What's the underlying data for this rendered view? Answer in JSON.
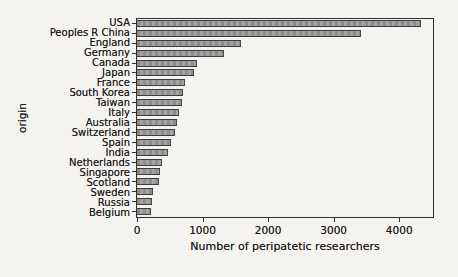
{
  "figure": {
    "background_color": "#f4f3ef",
    "bar_fill_color": "#989898",
    "bar_edge_color": "#3c3c3c",
    "frame_color": "#2e2e2e",
    "text_color": "#1b1b1b"
  },
  "chart_data": {
    "type": "bar",
    "orientation": "horizontal",
    "title": "",
    "xlabel": "Number of peripatetic researchers",
    "ylabel": "origin",
    "xlim": [
      0,
      4515
    ],
    "xticks": [
      0,
      1000,
      2000,
      3000,
      4000
    ],
    "grid": false,
    "legend": false,
    "categories": [
      "USA",
      "Peoples R China",
      "England",
      "Germany",
      "Canada",
      "Japan",
      "France",
      "South Korea",
      "Taiwan",
      "Italy",
      "Australia",
      "Switzerland",
      "Spain",
      "India",
      "Netherlands",
      "Singapore",
      "Scotland",
      "Sweden",
      "Russia",
      "Belgium"
    ],
    "values": [
      4330,
      3420,
      1590,
      1320,
      910,
      865,
      735,
      705,
      680,
      645,
      605,
      585,
      520,
      470,
      380,
      345,
      335,
      238,
      225,
      212
    ]
  }
}
